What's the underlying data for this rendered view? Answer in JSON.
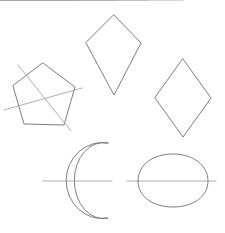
{
  "canvas": {
    "width": 225,
    "height": 233,
    "background_color": "#ffffff",
    "outline_color": "#6e6e72",
    "symmetry_line_color": "#9a9a9e",
    "outline_stroke_width": 0.9,
    "symmetry_stroke_width": 0.8,
    "description": "Five outlined geometric shapes each drawn with one or two straight lines of symmetry"
  },
  "figures": [
    {
      "id": "pentagon",
      "name": "tilted-pentagon",
      "shape_type": "polygon",
      "symmetry_line_count": 2,
      "points": "43,63 75,87 64,125 24,124 13,86",
      "symmetry_lines": [
        {
          "id": "pentagon-symmetry-line-1",
          "x1": 18,
          "y1": 65,
          "x2": 71,
          "y2": 131
        },
        {
          "id": "pentagon-symmetry-line-2",
          "x1": 4,
          "y1": 110,
          "x2": 82,
          "y2": 88
        }
      ]
    },
    {
      "id": "kite-top",
      "name": "upper-kite",
      "shape_type": "polygon",
      "symmetry_line_count": 2,
      "points": "114,15 141,43 114,95 86,43",
      "symmetry_lines": [
        {
          "id": "kite-top-vertical-axis",
          "x1": 114,
          "y1": 4,
          "x2": 114,
          "y2": 99
        },
        {
          "id": "kite-top-horizontal-axis",
          "x1": 77,
          "y1": 43,
          "x2": 152,
          "y2": 43
        }
      ]
    },
    {
      "id": "rhombus-right",
      "name": "right-rhombus",
      "shape_type": "polygon",
      "symmetry_line_count": 2,
      "points": "183,59 211,98 183,137 155,98",
      "symmetry_lines": [
        {
          "id": "rhombus-right-vertical-axis",
          "x1": 183,
          "y1": 50,
          "x2": 183,
          "y2": 145
        },
        {
          "id": "rhombus-right-horizontal-axis",
          "x1": 148,
          "y1": 98,
          "x2": 219,
          "y2": 98
        }
      ]
    },
    {
      "id": "crescent",
      "name": "crescent-moon",
      "shape_type": "crescent",
      "symmetry_line_count": 1,
      "path": "M 108,143 A 36,38 0 1 0 108,218 A 29,38 0 1 1 108,143 Z",
      "symmetry_lines": [
        {
          "id": "crescent-horizontal-axis",
          "x1": 43,
          "y1": 181,
          "x2": 112,
          "y2": 181
        }
      ]
    },
    {
      "id": "egg",
      "name": "egg-oval",
      "shape_type": "oval",
      "symmetry_line_count": 1,
      "path": "M 138,181 C 138,163 155,154 173,154 C 194,154 208,166 208,181 C 208,196 194,207 173,207 C 155,207 138,198 138,181 Z",
      "symmetry_lines": [
        {
          "id": "egg-horizontal-axis",
          "x1": 127,
          "y1": 181,
          "x2": 216,
          "y2": 181
        }
      ]
    }
  ]
}
